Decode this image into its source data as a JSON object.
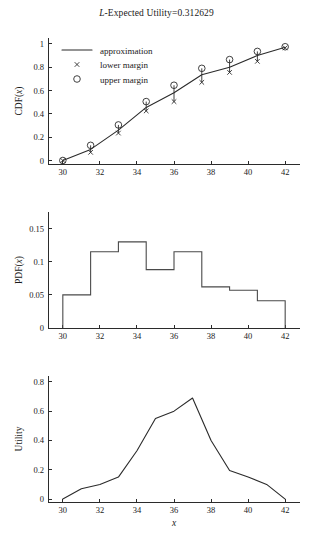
{
  "figure": {
    "title_prefix": "L",
    "title_rest": "-Expected Utility=0.312629",
    "title_full": "L-Expected Utility=0.312629"
  },
  "chart_data": [
    {
      "type": "line",
      "id": "cdf-panel",
      "title": "",
      "xlabel": "",
      "ylabel": "CDF(x)",
      "xlim": [
        29.2,
        42.8
      ],
      "ylim": [
        -0.03,
        1.05
      ],
      "xticks": [
        30,
        32,
        34,
        36,
        38,
        40,
        42
      ],
      "yticks": [
        0,
        0.2,
        0.4,
        0.6,
        0.8,
        1
      ],
      "xticklabels": [
        "30",
        "32",
        "34",
        "36",
        "38",
        "40",
        "42"
      ],
      "yticklabels": [
        "0",
        "0.2",
        "0.4",
        "0.6",
        "0.8",
        "1"
      ],
      "grid": false,
      "legend_position": "upper-left",
      "legend": [
        "approximation",
        "lower margin",
        "upper margin"
      ],
      "x": [
        30,
        31.5,
        33,
        34.5,
        36,
        37.5,
        39,
        40.5,
        42
      ],
      "series": [
        {
          "name": "approximation",
          "marker": "line",
          "values": [
            0.0,
            0.095,
            0.26,
            0.455,
            0.58,
            0.735,
            0.8,
            0.9,
            0.97
          ]
        },
        {
          "name": "lower margin",
          "marker": "x",
          "values": [
            0.0,
            0.07,
            0.235,
            0.425,
            0.505,
            0.67,
            0.755,
            0.85,
            0.965
          ]
        },
        {
          "name": "upper margin",
          "marker": "circle",
          "values": [
            0.0,
            0.13,
            0.305,
            0.505,
            0.645,
            0.79,
            0.865,
            0.935,
            0.975
          ]
        }
      ]
    },
    {
      "type": "bar",
      "id": "pdf-panel",
      "title": "",
      "xlabel": "",
      "ylabel": "PDF(x)",
      "xlim": [
        29.2,
        42.8
      ],
      "ylim": [
        0,
        0.175
      ],
      "xticks": [
        30,
        32,
        34,
        36,
        38,
        40,
        42
      ],
      "yticks": [
        0,
        0.05,
        0.1,
        0.15
      ],
      "xticklabels": [
        "30",
        "32",
        "34",
        "36",
        "38",
        "40",
        "42"
      ],
      "yticklabels": [
        "0",
        "0.05",
        "0.1",
        "0.15"
      ],
      "grid": false,
      "bin_edges": [
        30,
        31.5,
        33,
        34.5,
        36,
        37.5,
        39,
        40.5,
        42
      ],
      "values": [
        0.05,
        0.115,
        0.13,
        0.088,
        0.115,
        0.062,
        0.057,
        0.041
      ]
    },
    {
      "type": "line",
      "id": "utility-panel",
      "title": "",
      "xlabel": "x",
      "ylabel": "Utility",
      "xlim": [
        29.2,
        42.8
      ],
      "ylim": [
        -0.02,
        0.84
      ],
      "xticks": [
        30,
        32,
        34,
        36,
        38,
        40,
        42
      ],
      "yticks": [
        0,
        0.2,
        0.4,
        0.6,
        0.8
      ],
      "xticklabels": [
        "30",
        "32",
        "34",
        "36",
        "38",
        "40",
        "42"
      ],
      "yticklabels": [
        "0",
        "0.2",
        "0.4",
        "0.6",
        "0.8"
      ],
      "grid": false,
      "x": [
        30,
        31,
        32,
        33,
        34,
        35,
        36,
        37,
        38,
        39,
        40,
        41,
        42
      ],
      "values": [
        0.0,
        0.07,
        0.1,
        0.15,
        0.33,
        0.55,
        0.6,
        0.69,
        0.4,
        0.195,
        0.15,
        0.1,
        0.0
      ]
    }
  ]
}
